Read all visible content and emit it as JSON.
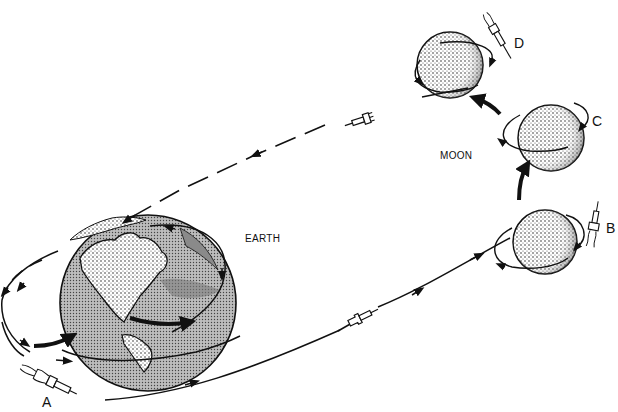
{
  "diagram": {
    "type": "lunar-mission-trajectory",
    "bodies": {
      "earth": {
        "label": "EARTH"
      },
      "moon": {
        "label": "MOON"
      }
    },
    "stages": [
      {
        "id": "A",
        "label": "A",
        "description": "launch from Earth orbit"
      },
      {
        "id": "B",
        "label": "B",
        "description": "lunar arrival / orbit insertion"
      },
      {
        "id": "C",
        "label": "C",
        "description": "lunar orbit"
      },
      {
        "id": "D",
        "label": "D",
        "description": "departure from Moon"
      }
    ],
    "colors": {
      "line": "#111111",
      "background": "#ffffff",
      "shade": "#9a9a9a"
    }
  }
}
